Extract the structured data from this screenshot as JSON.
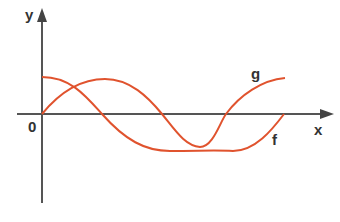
{
  "diagram": {
    "axes": {
      "x_label": "x",
      "y_label": "y",
      "origin_label": "0"
    },
    "curves": [
      {
        "name": "f",
        "label": "f",
        "shape": "cosine-like",
        "color": "#e0532e"
      },
      {
        "name": "g",
        "label": "g",
        "shape": "sine-like",
        "color": "#e0532e"
      }
    ],
    "colors": {
      "axis": "#555555",
      "curve": "#e0532e"
    }
  }
}
